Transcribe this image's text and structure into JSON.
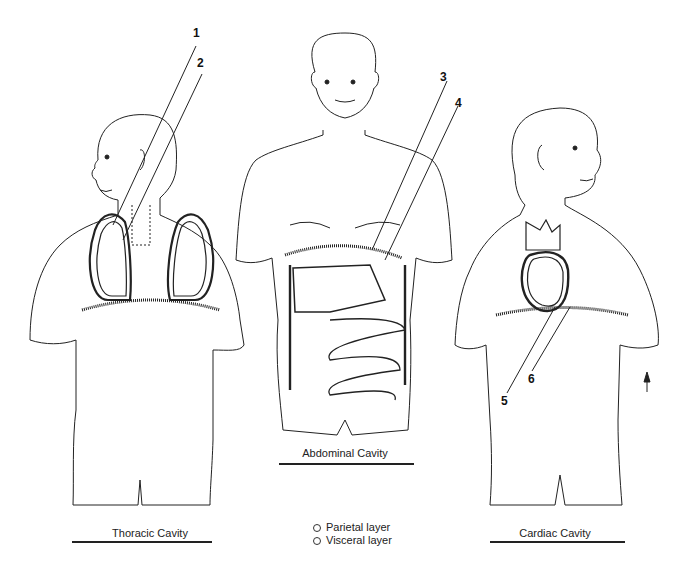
{
  "figures": [
    {
      "caption": "Thoracic Cavity",
      "callouts": [
        {
          "number": "1",
          "x": 197,
          "y": 31
        },
        {
          "number": "2",
          "x": 200,
          "y": 62
        }
      ]
    },
    {
      "caption": "Abdominal Cavity",
      "callouts": [
        {
          "number": "3",
          "x": 442,
          "y": 75
        },
        {
          "number": "4",
          "x": 455,
          "y": 100
        }
      ]
    },
    {
      "caption": "Cardiac Cavity",
      "callouts": [
        {
          "number": "5",
          "x": 500,
          "y": 396
        },
        {
          "number": "6",
          "x": 526,
          "y": 374
        }
      ]
    }
  ],
  "legend": {
    "items": [
      {
        "label": "Parietal layer"
      },
      {
        "label": "Visceral layer"
      }
    ]
  },
  "arrow": {
    "direction": "up"
  },
  "colors": {
    "line": "#1a1a1a",
    "background": "#ffffff"
  }
}
